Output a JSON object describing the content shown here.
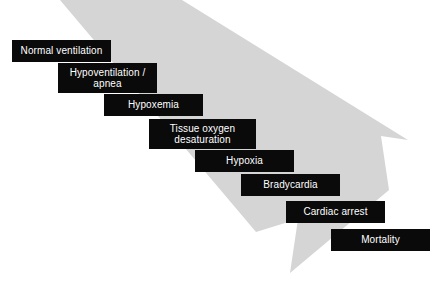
{
  "figure": {
    "background_color": "#ffffff",
    "arrow": {
      "name": "downward-cascade-arrow",
      "color": "#d5d5d5",
      "direction": "down-right"
    },
    "box_style": {
      "fill": "#0a0a0a",
      "text_color": "#ffffff"
    },
    "steps": [
      {
        "label": "Normal ventilation",
        "lines": 1,
        "x": 12,
        "y": 40,
        "w": 99,
        "h": 22
      },
      {
        "label": "Hypoventilation /\napnea",
        "lines": 2,
        "x": 58,
        "y": 63,
        "w": 99,
        "h": 30
      },
      {
        "label": "Hypoxemia",
        "lines": 1,
        "x": 104,
        "y": 94,
        "w": 99,
        "h": 22
      },
      {
        "label": "Tissue oxygen\ndesaturation",
        "lines": 2,
        "x": 149,
        "y": 119,
        "w": 107,
        "h": 30
      },
      {
        "label": "Hypoxia",
        "lines": 1,
        "x": 195,
        "y": 150,
        "w": 99,
        "h": 22
      },
      {
        "label": "Bradycardia",
        "lines": 1,
        "x": 241,
        "y": 174,
        "w": 99,
        "h": 22
      },
      {
        "label": "Cardiac arrest",
        "lines": 1,
        "x": 286,
        "y": 201,
        "w": 99,
        "h": 22
      },
      {
        "label": "Mortality",
        "lines": 1,
        "x": 331,
        "y": 229,
        "w": 99,
        "h": 22
      }
    ],
    "caption": ""
  }
}
